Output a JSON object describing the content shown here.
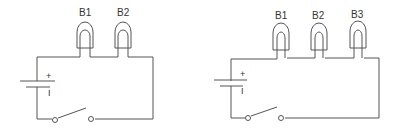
{
  "diagrams": [
    {
      "name": "circuit-two-bulbs",
      "bulbs": [
        {
          "label": "B1"
        },
        {
          "label": "B2"
        }
      ],
      "battery": {
        "positive": "+",
        "negative": "I"
      },
      "switch": "open"
    },
    {
      "name": "circuit-three-bulbs",
      "bulbs": [
        {
          "label": "B1"
        },
        {
          "label": "B2"
        },
        {
          "label": "B3"
        }
      ],
      "battery": {
        "positive": "+",
        "negative": "I"
      },
      "switch": "open"
    }
  ]
}
